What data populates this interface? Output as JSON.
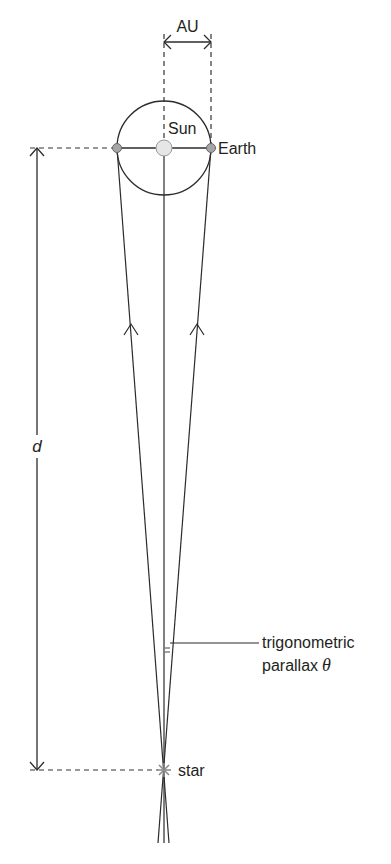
{
  "diagram": {
    "labels": {
      "au": "AU",
      "sun": "Sun",
      "earth": "Earth",
      "distance": "d",
      "parallax_line1": "trigonometric",
      "parallax_line2": "parallax",
      "theta": "θ",
      "star": "star"
    },
    "colors": {
      "line": "#2b2b2b",
      "dash": "#333333",
      "earth_fill": "#a6a6a6",
      "sun_fill": "#e6e6e6",
      "star": "#8c8c8c",
      "text": "#231f20"
    }
  }
}
